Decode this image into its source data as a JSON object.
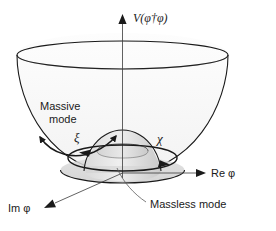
{
  "figure": {
    "background_color": "#ffffff",
    "line_color": "#1a1a1a",
    "fill_color": "#e8e8e8"
  },
  "axes": {
    "vertical": {
      "label": "V(φ†φ)",
      "label_plain": "V(phi-dagger phi)",
      "icon": "arrow-up-icon"
    },
    "horizontal_right": {
      "label": "Re φ",
      "label_plain": "Re phi",
      "icon": "arrow-right-icon"
    },
    "horizontal_depth": {
      "label": "Im φ",
      "label_plain": "Im phi",
      "icon": "arrow-down-left-icon"
    }
  },
  "annotations": {
    "massive_mode": {
      "line1": "Massive",
      "line2": "mode"
    },
    "massless_mode": {
      "label": "Massless mode"
    },
    "radial_symbol": {
      "label": "ξ",
      "label_plain": "xi"
    },
    "angular_symbol": {
      "label": "χ",
      "label_plain": "chi"
    }
  }
}
